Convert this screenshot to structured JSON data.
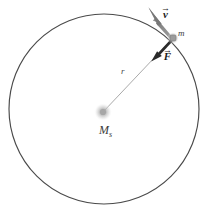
{
  "figure": {
    "kind": "orbital-mechanics-diagram",
    "background_color": "#ffffff",
    "colors": {
      "orbit_stroke": "#4a4a4a",
      "radius_stroke": "#8c8c8c",
      "force_arrow": "#2b2b2b",
      "velocity_arrow": "#8a8a8a",
      "central_body": "#b8b8b8",
      "particle": "#9a9a9a",
      "label_text": "#2b2b2b"
    },
    "geometry": {
      "orbit_center_x": 104,
      "orbit_center_y": 109,
      "orbit_radius": 95,
      "central_body_x": 103,
      "central_body_y": 112,
      "particle_x": 173,
      "particle_y": 38,
      "velocity_tip_x": 149,
      "velocity_tip_y": 7,
      "force_tip_x": 152,
      "force_tip_y": 61
    },
    "labels": {
      "radius": "r",
      "mass": "m",
      "central_mass": "M",
      "central_mass_subscript": "s",
      "velocity_symbol": "v",
      "velocity_accent": "→",
      "force_symbol": "F",
      "force_accent": "→"
    }
  }
}
